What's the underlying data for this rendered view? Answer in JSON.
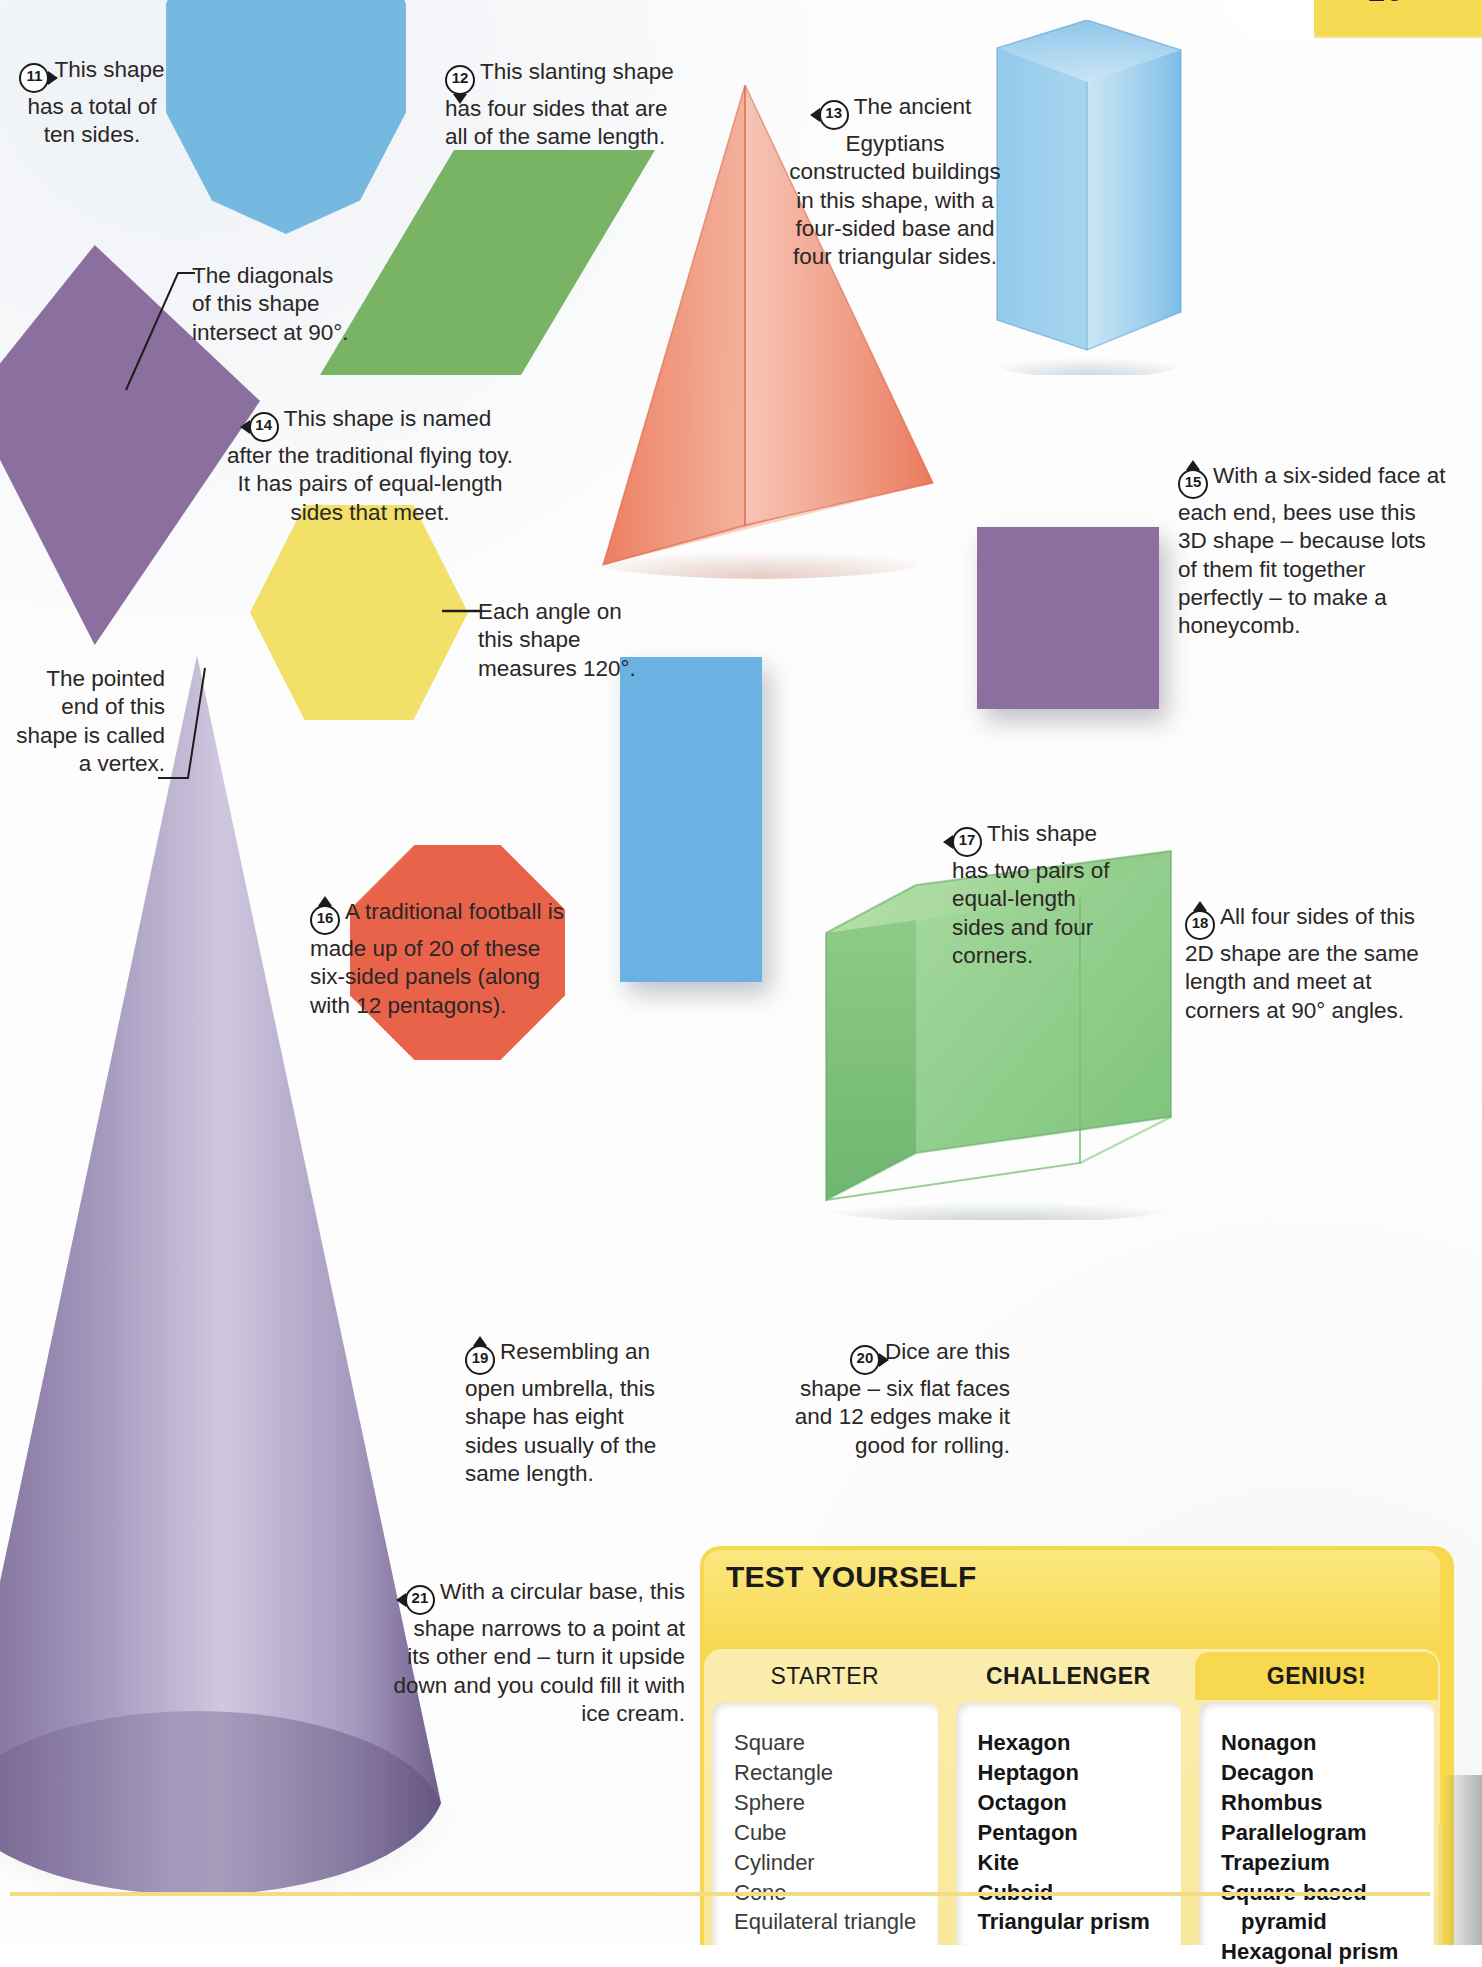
{
  "page": {
    "number": "25",
    "accent_yellow": "#f7d84e",
    "page_bg": "#fdfdfd"
  },
  "shapes": [
    {
      "id": "decagon",
      "name": "decagon",
      "color": "#76b9e0",
      "kind": "2D"
    },
    {
      "id": "rhombus",
      "name": "rhombus",
      "color": "#78b464",
      "kind": "2D"
    },
    {
      "id": "kite",
      "name": "kite",
      "color": "#8b6f9e",
      "kind": "2D"
    },
    {
      "id": "hexagon",
      "name": "hexagon",
      "color": "#f2e068",
      "kind": "2D"
    },
    {
      "id": "octagon",
      "name": "octagon",
      "color": "#e8634a",
      "kind": "2D"
    },
    {
      "id": "rect17",
      "name": "rectangle",
      "color": "#6bb2e2",
      "kind": "2D"
    },
    {
      "id": "square18",
      "name": "square",
      "color": "#8b6f9e",
      "kind": "2D"
    },
    {
      "id": "pyramid",
      "name": "square-based pyramid",
      "color": "#ef7a5c",
      "kind": "3D"
    },
    {
      "id": "hexprism",
      "name": "hexagonal prism",
      "color": "#7cc0e8",
      "kind": "3D"
    },
    {
      "id": "cube",
      "name": "cube",
      "color": "#86c97e",
      "kind": "3D"
    },
    {
      "id": "cone",
      "name": "cone",
      "color": "#9b8cb5",
      "kind": "3D"
    }
  ],
  "callouts": [
    {
      "num": "11",
      "pointer": "right",
      "align": "center",
      "text": "This shape has a total of ten sides."
    },
    {
      "num": "12",
      "pointer": "down",
      "align": "left",
      "text": "This slanting shape has four sides that are all of the same length."
    },
    {
      "num": "13",
      "pointer": "left",
      "align": "center",
      "text": "The ancient Egyptians constructed buildings in this shape, with a four-sided base and four triangular sides."
    },
    {
      "num": "14",
      "pointer": "left",
      "align": "center",
      "text": "This shape is named after the traditional flying toy. It has pairs of equal-length sides that meet."
    },
    {
      "num": "15",
      "pointer": "up",
      "align": "left",
      "text": "With a six-sided face at each end, bees use this 3D shape – because lots of them fit together perfectly – to make a honeycomb."
    },
    {
      "num": "16",
      "pointer": "up",
      "align": "left",
      "text": "A traditional football is made up of 20 of these six-sided panels (along with 12 pentagons)."
    },
    {
      "num": "17",
      "pointer": "left",
      "align": "left",
      "text": "This shape has two pairs of equal-length sides and four corners."
    },
    {
      "num": "18",
      "pointer": "up",
      "align": "left",
      "text": "All four sides of this 2D shape are the same length and meet at corners at 90° angles."
    },
    {
      "num": "19",
      "pointer": "up",
      "align": "left",
      "text": "Resembling an open umbrella, this shape has eight sides usually of the same length."
    },
    {
      "num": "20",
      "pointer": "right",
      "align": "right",
      "text": "Dice are this shape – six flat faces and 12 edges make it good for rolling."
    },
    {
      "num": "21",
      "pointer": "left",
      "align": "right",
      "text": "With a circular base, this shape narrows to a point at its other end – turn it upside down and you could fill it with ice cream."
    }
  ],
  "annotations": [
    {
      "id": "diagonals",
      "align": "left",
      "text": "The diagonals of this shape intersect at 90°."
    },
    {
      "id": "vertex",
      "align": "right",
      "text": "The pointed end of this shape is called a vertex."
    },
    {
      "id": "angle120",
      "align": "left",
      "text": "Each angle on this shape measures 120°."
    }
  ],
  "test_yourself": {
    "title": "TEST YOURSELF",
    "columns": [
      {
        "heading": "STARTER",
        "items": [
          "Square",
          "Rectangle",
          "Sphere",
          "Cube",
          "Cylinder",
          "Cone",
          "Equilateral triangle"
        ]
      },
      {
        "heading": "CHALLENGER",
        "items": [
          "Hexagon",
          "Heptagon",
          "Octagon",
          "Pentagon",
          "Kite",
          "Cuboid",
          "Triangular prism"
        ]
      },
      {
        "heading": "GENIUS!",
        "items": [
          "Nonagon",
          "Decagon",
          "Rhombus",
          "Parallelogram",
          "Trapezium",
          "Square-based",
          "pyramid",
          "Hexagonal prism"
        ]
      }
    ]
  }
}
